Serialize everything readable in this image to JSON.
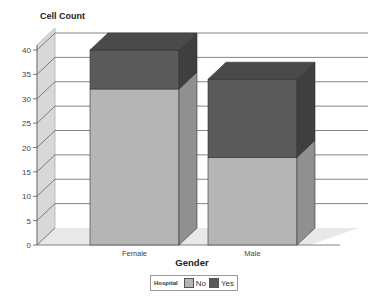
{
  "chart_data": {
    "type": "bar",
    "stacked": true,
    "three_d": true,
    "title": "Cell Count",
    "xlabel": "Gender",
    "ylabel": "Cell Count",
    "categories": [
      "Female",
      "Male"
    ],
    "series": [
      {
        "name": "No",
        "values": [
          32,
          18
        ],
        "color": "#b5b5b5"
      },
      {
        "name": "Yes",
        "values": [
          8,
          16
        ],
        "color": "#5a5a5a"
      }
    ],
    "ylim": [
      0,
      40
    ],
    "yticks": [
      0,
      5,
      10,
      15,
      20,
      25,
      30,
      35,
      40
    ],
    "grid": true,
    "legend": {
      "title": "Hospital",
      "position": "bottom",
      "entries": [
        "No",
        "Yes"
      ]
    }
  }
}
